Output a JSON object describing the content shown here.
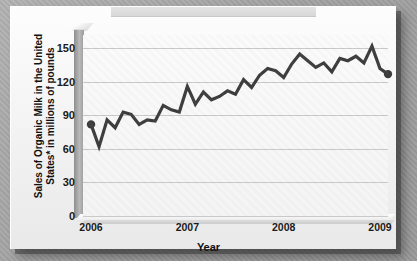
{
  "chart_data": {
    "type": "line",
    "title": "",
    "xlabel": "Year",
    "ylabel": "Sales of Organic Milk in the United States* in millions of pounds",
    "ylim": [
      0,
      162
    ],
    "yticks": [
      0,
      30,
      60,
      90,
      120,
      150
    ],
    "ytick_labels": [
      "0",
      "30",
      "60",
      "90",
      "120",
      "150"
    ],
    "xlim": [
      0,
      38
    ],
    "xticks": [
      1,
      13,
      25,
      37
    ],
    "xtick_labels": [
      "2006",
      "2007",
      "2008",
      "2009"
    ],
    "grid": true,
    "legend": false,
    "line_color": "#3d3d3d",
    "marker_color": "#3d3d3d",
    "markers": [
      "first",
      "last"
    ],
    "series": [
      {
        "name": "Sales of Organic Milk",
        "x": [
          1,
          2,
          3,
          4,
          5,
          6,
          7,
          8,
          9,
          10,
          11,
          12,
          13,
          14,
          15,
          16,
          17,
          18,
          19,
          20,
          21,
          22,
          23,
          24,
          25,
          26,
          27,
          28,
          29,
          30,
          31,
          32,
          33,
          34,
          35,
          36,
          37,
          38
        ],
        "values": [
          82,
          62,
          86,
          79,
          93,
          91,
          82,
          86,
          85,
          99,
          95,
          93,
          116,
          100,
          111,
          104,
          107,
          112,
          109,
          122,
          115,
          126,
          132,
          130,
          124,
          136,
          145,
          139,
          133,
          137,
          129,
          141,
          139,
          143,
          137,
          152,
          132,
          127
        ]
      }
    ]
  },
  "axis": {
    "y_title_line1": "Sales of Organic Milk in the United",
    "y_title_line2": "States* in millions of pounds",
    "x_title": "Year"
  }
}
